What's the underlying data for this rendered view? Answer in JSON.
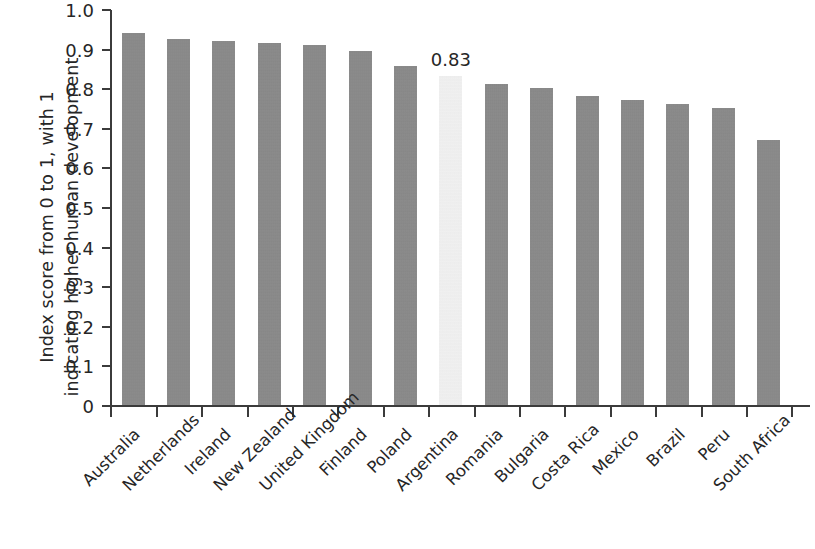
{
  "chart_data": {
    "type": "bar",
    "title": "",
    "xlabel": "",
    "ylabel": "Index score from 0 to 1, with 1 indicating higher human development",
    "ylabel_lines": [
      "Index score from 0 to 1, with 1",
      "indicating higher human development"
    ],
    "ylim": [
      0,
      1.0
    ],
    "ytick_labels": [
      "1.0",
      "0.9",
      "0.8",
      "0.7",
      "0.6",
      "0.5",
      "0.4",
      "0.3",
      "0.2",
      "0.1",
      "0"
    ],
    "ytick_values": [
      1.0,
      0.9,
      0.8,
      0.7,
      0.6,
      0.5,
      0.4,
      0.3,
      0.2,
      0.1,
      0
    ],
    "grid": false,
    "legend": false,
    "categories": [
      "Australia",
      "Netherlands",
      "Ireland",
      "New Zealand",
      "United Kingdom",
      "Finland",
      "Poland",
      "Argentina",
      "Romania",
      "Bulgaria",
      "Costa Rica",
      "Mexico",
      "Brazil",
      "Peru",
      "South Africa"
    ],
    "values": [
      0.94,
      0.925,
      0.92,
      0.915,
      0.91,
      0.895,
      0.855,
      0.83,
      0.81,
      0.8,
      0.78,
      0.77,
      0.76,
      0.75,
      0.67
    ],
    "highlight_index": 7,
    "highlight_label": "0.83",
    "bar_color": "#878787",
    "highlight_color": "#f1f1f1",
    "axis_color": "#3b3b3b",
    "text_color": "#262626",
    "background_color": "#ffffff"
  }
}
